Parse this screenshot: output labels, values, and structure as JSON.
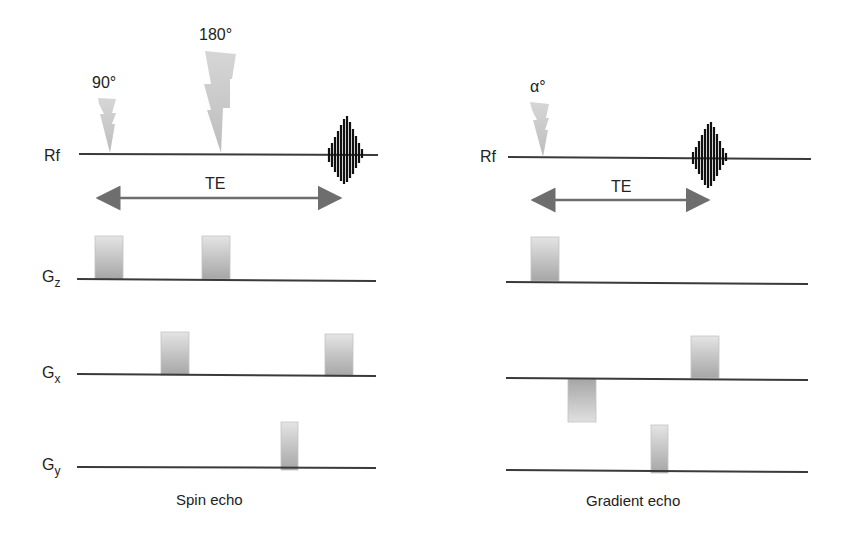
{
  "colors": {
    "line": "#3a3a3a",
    "pulse_fill_top": "#e2e2e2",
    "pulse_fill_bottom": "#a9a9a9",
    "arrow": "#6e6e6e",
    "echo": "#111111",
    "bolt": "#c8c8c8"
  },
  "spin_echo": {
    "caption": "Spin echo",
    "rf_label": "Rf",
    "te_label": "TE",
    "pulses": [
      {
        "label": "90°",
        "type": "rf-90"
      },
      {
        "label": "180°",
        "type": "rf-180"
      }
    ],
    "gz_label": "G",
    "gz_sub": "z",
    "gx_label": "G",
    "gx_sub": "x",
    "gy_label": "G",
    "gy_sub": "y"
  },
  "gradient_echo": {
    "caption": "Gradient echo",
    "rf_label": "Rf",
    "te_label": "TE",
    "pulses": [
      {
        "label": "α°",
        "type": "rf-alpha"
      }
    ]
  }
}
